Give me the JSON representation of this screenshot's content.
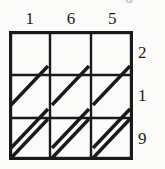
{
  "figure": {
    "kind": "lattice-multiplication-grid",
    "rows": 3,
    "columns": 3,
    "diagonal_direction": "bottom-left-to-top-right",
    "cells_empty": true,
    "line_color": "#1a1a1a",
    "background_color": "#fbfbf9",
    "text_color": "#1b1b1b"
  },
  "top_labels": [
    {
      "value": "1"
    },
    {
      "value": "6"
    },
    {
      "value": "5"
    }
  ],
  "right_labels": [
    {
      "value": "2"
    },
    {
      "value": "1"
    },
    {
      "value": "9"
    }
  ],
  "clipped_text": {
    "value": "0"
  }
}
